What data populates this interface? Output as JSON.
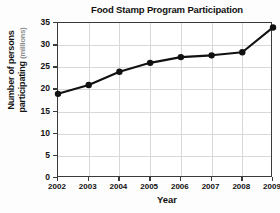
{
  "chart_data": {
    "type": "line",
    "title": "Food Stamp Program Participation",
    "xlabel": "Year",
    "ylabel": "Number of persons participating",
    "ylabel_line1": "Number of persons",
    "ylabel_line2": "participating",
    "yunits": "(millions)",
    "categories": [
      "2002",
      "2003",
      "2004",
      "2005",
      "2006",
      "2007",
      "2008",
      "2009"
    ],
    "x": [
      2002,
      2003,
      2004,
      2005,
      2006,
      2007,
      2008,
      2009
    ],
    "values": [
      19,
      21,
      24,
      26,
      27.3,
      27.7,
      28.4,
      34
    ],
    "series": [
      {
        "name": "Food Stamp Program Participation",
        "values": [
          19,
          21,
          24,
          26,
          27.3,
          27.7,
          28.4,
          34
        ]
      }
    ],
    "ylim": [
      0,
      35
    ],
    "yticks": [
      0,
      5,
      10,
      15,
      20,
      25,
      30,
      35
    ],
    "ytick_labels": [
      "0",
      "5",
      "10",
      "15",
      "20",
      "25",
      "30",
      "35"
    ],
    "xlim": [
      2002,
      2009
    ],
    "grid": true,
    "legend": false,
    "marker": "circle",
    "line_color": "#111111",
    "marker_color": "#111111",
    "grid_color": "#d8d8d8",
    "axis_color": "#3a3a3a",
    "background_color": "#ffffff"
  }
}
